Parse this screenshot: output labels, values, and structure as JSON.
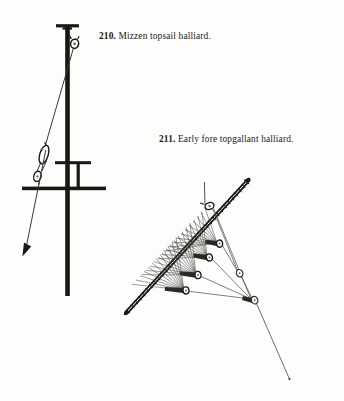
{
  "page": {
    "background_color": "#fdfdfc",
    "ink_color": "#1a1715",
    "line_color": "#3a3734",
    "width": 344,
    "height": 401
  },
  "captions": [
    {
      "id": "caption-210",
      "number": "210.",
      "text": " Mizzen topsail halliard.",
      "x": 99,
      "y": 32
    },
    {
      "id": "caption-211",
      "number": "211.",
      "text": " Early fore topgallant halliard.",
      "x": 159,
      "y": 135
    }
  ],
  "figures": [
    {
      "id": "figure-210",
      "name": "mizzen-topsail-halliard-diagram",
      "description": "Vertical mast with cap at top, sheave block below cap, upper crosstree and lower yard, luff tackle with two blocks at left, hauling part ending in a downward arrow.",
      "parts": [
        "mast-pole",
        "mast-cap",
        "masthead-sheave-block",
        "upper-crosstree",
        "lower-yard",
        "upper-tackle-block",
        "lower-tackle-block",
        "halliard-fall",
        "hauling-arrow"
      ]
    },
    {
      "id": "figure-211",
      "name": "early-fore-topgallant-halliard-diagram",
      "description": "Diagonal served spar running from upper right to lower left, with a block near the upper end, a fan of whip lines converging from the spar to a descending chain of four blocks, and a long standing part running off to lower right.",
      "parts": [
        "diagonal-spar",
        "spar-head-block",
        "whip-line-fan",
        "block-1",
        "block-2",
        "block-3",
        "block-4",
        "standing-part",
        "fall-tail"
      ]
    }
  ]
}
